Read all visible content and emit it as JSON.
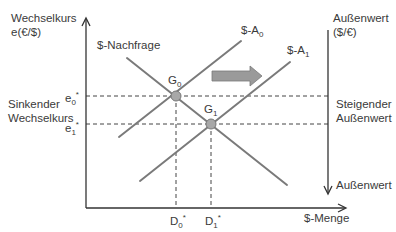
{
  "diagram": {
    "y_axis_label_line1": "Wechselkurs",
    "y_axis_label_line2": "e(€/$)",
    "x_axis_label": "$-Menge",
    "right_axis_label_line1": "Außenwert",
    "right_axis_label_line2": "($/€)",
    "right_axis_bottom_label": "Außenwert",
    "left_annotation_line1": "Sinkender",
    "left_annotation_line2": "Wechselkurs",
    "right_annotation_line1": "Steigender",
    "right_annotation_line2": "Außenwert",
    "demand_curve_label": "$-Nachfrage",
    "supply0": {
      "prefix": "$-A",
      "sub": "0"
    },
    "supply1": {
      "prefix": "$-A",
      "sub": "1"
    },
    "g0": {
      "prefix": "G",
      "sub": "0"
    },
    "g1": {
      "prefix": "G",
      "sub": "1"
    },
    "e0": {
      "prefix": "e",
      "sub": "0",
      "sup": "*"
    },
    "e1": {
      "prefix": "e",
      "sub": "1",
      "sup": "*"
    },
    "d0": {
      "prefix": "D",
      "sub": "0",
      "sup": "*"
    },
    "d1": {
      "prefix": "D",
      "sub": "1",
      "sup": "*"
    },
    "colors": {
      "curve": "#7a7a7a",
      "axis": "#333333",
      "point_fill": "#a8a8a8",
      "shift_arrow": "#9a9a9a"
    }
  }
}
